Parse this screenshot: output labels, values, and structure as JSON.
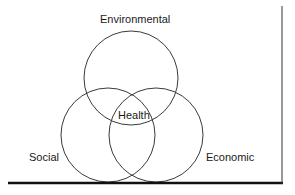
{
  "diagram": {
    "type": "venn",
    "sets": [
      {
        "id": "environmental",
        "label": "Environmental"
      },
      {
        "id": "social",
        "label": "Social"
      },
      {
        "id": "economic",
        "label": "Economic"
      }
    ],
    "intersection_label": "Health",
    "colors": {
      "stroke": "#3a3a3a",
      "axis": "#111111",
      "text": "#1a1a1a"
    }
  }
}
